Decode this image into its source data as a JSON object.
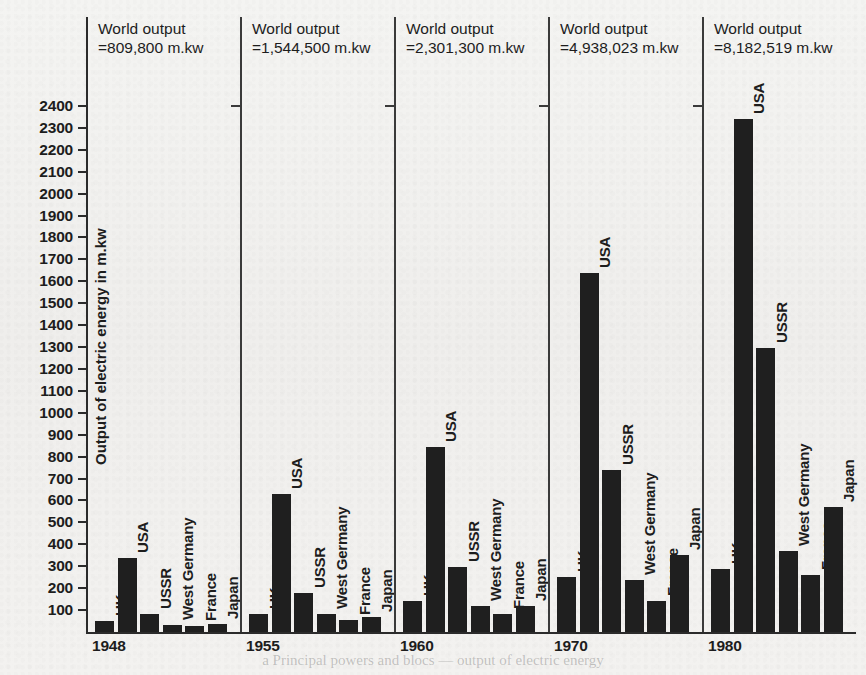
{
  "ghost_text": {
    "top": "",
    "bottom": "a Principal powers and blocs — output of electric energy"
  },
  "chart_data": {
    "type": "bar",
    "title": "",
    "xlabel": "",
    "ylabel": "Output of electric energy in m.kw",
    "ylim": [
      0,
      2450
    ],
    "ytick_step": 100,
    "yticks": [
      100,
      200,
      300,
      400,
      500,
      600,
      700,
      800,
      900,
      1000,
      1100,
      1200,
      1300,
      1400,
      1500,
      1600,
      1700,
      1800,
      1900,
      2000,
      2100,
      2200,
      2300,
      2400
    ],
    "categories": [
      "UK",
      "USA",
      "USSR",
      "West Germany",
      "France",
      "Japan"
    ],
    "grid": false,
    "legend": "none",
    "groups": [
      {
        "year": "1948",
        "world_output_line1": "World output",
        "world_output_line2": "=809,800 m.kw",
        "values": [
          50,
          336,
          80,
          32,
          27,
          38
        ]
      },
      {
        "year": "1955",
        "world_output_line1": "World output",
        "world_output_line2": "=1,544,500 m.kw",
        "values": [
          82,
          629,
          176,
          80,
          55,
          70
        ]
      },
      {
        "year": "1960",
        "world_output_line1": "World output",
        "world_output_line2": "=2,301,300 m.kw",
        "values": [
          140,
          845,
          296,
          120,
          80,
          120
        ]
      },
      {
        "year": "1970",
        "world_output_line1": "World output",
        "world_output_line2": "=4,938,023 m.kw",
        "values": [
          250,
          1636,
          740,
          236,
          140,
          350
        ]
      },
      {
        "year": "1980",
        "world_output_line1": "World output",
        "world_output_line2": "=8,182,519 m.kw",
        "values": [
          289,
          2340,
          1295,
          370,
          258,
          572
        ]
      }
    ]
  },
  "colors": {
    "bar": "#1f1f1f",
    "axis": "#2b2b2b",
    "background": "#f2f2f0",
    "text": "#1d1d1d"
  }
}
